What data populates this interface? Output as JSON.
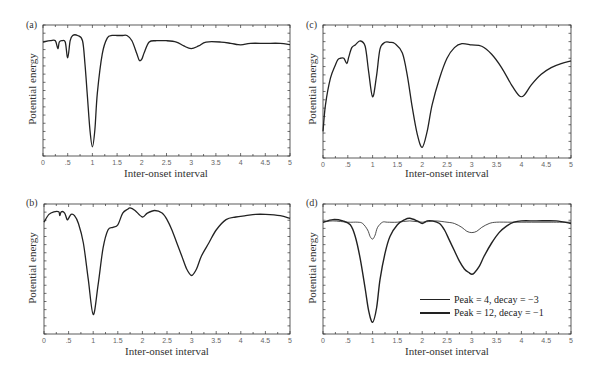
{
  "chart_data": [
    {
      "panel": "(a)",
      "type": "line",
      "xlabel": "Inter-onset interval",
      "ylabel": "Potential energy",
      "xlim": [
        0,
        5
      ],
      "ylim": [
        0,
        1
      ],
      "xticks": [
        "0",
        ".5",
        "1",
        "1.5",
        "2",
        "2.5",
        "3",
        "3.5",
        "4",
        "4.5",
        "5"
      ],
      "yticks_labeled": false,
      "grid": false,
      "frame": {
        "left": 43,
        "top": 25,
        "right": 290,
        "bottom": 156
      },
      "series": [
        {
          "name": "energy",
          "width": 1.3,
          "x": [
            0,
            0.15,
            0.25,
            0.3,
            0.33,
            0.38,
            0.45,
            0.5,
            0.55,
            0.6,
            0.7,
            0.8,
            0.85,
            0.9,
            0.95,
            1.0,
            1.05,
            1.1,
            1.2,
            1.3,
            1.4,
            1.5,
            1.6,
            1.7,
            1.8,
            1.9,
            1.95,
            2.0,
            2.05,
            2.15,
            2.3,
            2.5,
            2.7,
            2.85,
            3.0,
            3.15,
            3.3,
            3.6,
            3.8,
            3.95,
            4.05,
            4.2,
            4.5,
            4.8,
            5.0
          ],
          "y": [
            0.87,
            0.88,
            0.88,
            0.82,
            0.87,
            0.88,
            0.87,
            0.75,
            0.88,
            0.92,
            0.92,
            0.88,
            0.7,
            0.45,
            0.2,
            0.07,
            0.2,
            0.48,
            0.78,
            0.9,
            0.92,
            0.92,
            0.92,
            0.92,
            0.88,
            0.78,
            0.73,
            0.74,
            0.79,
            0.87,
            0.88,
            0.88,
            0.87,
            0.84,
            0.82,
            0.84,
            0.87,
            0.87,
            0.86,
            0.85,
            0.85,
            0.86,
            0.86,
            0.86,
            0.85
          ]
        }
      ]
    },
    {
      "panel": "(b)",
      "type": "line",
      "xlabel": "Inter-onset interval",
      "ylabel": "Potential energy",
      "xlim": [
        0,
        5
      ],
      "ylim": [
        0,
        1
      ],
      "xticks": [
        "0",
        ".5",
        "1",
        "1.5",
        "2",
        "2.5",
        "3",
        "3.5",
        "4",
        "4.5",
        "5"
      ],
      "yticks_labeled": false,
      "grid": false,
      "frame": {
        "left": 44,
        "top": 204,
        "right": 290,
        "bottom": 334
      },
      "series": [
        {
          "name": "energy",
          "width": 1.3,
          "x": [
            0,
            0.1,
            0.2,
            0.3,
            0.32,
            0.35,
            0.42,
            0.47,
            0.5,
            0.55,
            0.62,
            0.7,
            0.8,
            0.9,
            1.0,
            1.1,
            1.2,
            1.3,
            1.4,
            1.5,
            1.6,
            1.7,
            1.75,
            1.85,
            2.0,
            2.1,
            2.25,
            2.4,
            2.5,
            2.6,
            2.7,
            2.8,
            2.9,
            3.0,
            3.1,
            3.2,
            3.35,
            3.5,
            3.7,
            3.9,
            4.1,
            4.3,
            4.5,
            4.8,
            5.0
          ],
          "y": [
            0.86,
            0.92,
            0.94,
            0.94,
            0.91,
            0.94,
            0.93,
            0.88,
            0.89,
            0.92,
            0.91,
            0.85,
            0.7,
            0.42,
            0.15,
            0.38,
            0.66,
            0.8,
            0.82,
            0.84,
            0.93,
            0.96,
            0.97,
            0.95,
            0.9,
            0.93,
            0.95,
            0.93,
            0.88,
            0.8,
            0.7,
            0.6,
            0.5,
            0.45,
            0.5,
            0.6,
            0.7,
            0.8,
            0.88,
            0.9,
            0.91,
            0.92,
            0.92,
            0.91,
            0.89
          ]
        }
      ]
    },
    {
      "panel": "(c)",
      "type": "line",
      "xlabel": "Inter-onset interval",
      "ylabel": "Potential energy",
      "xlim": [
        0,
        5
      ],
      "ylim": [
        0,
        1
      ],
      "xticks": [
        "0",
        ".5",
        "1",
        "1.5",
        "2",
        "2.5",
        "3",
        "3.5",
        "4",
        "4.5",
        "5"
      ],
      "yticks_labeled": false,
      "grid": false,
      "frame": {
        "left": 323,
        "top": 25,
        "right": 571,
        "bottom": 158
      },
      "series": [
        {
          "name": "energy",
          "width": 1.3,
          "x": [
            0,
            0.05,
            0.15,
            0.25,
            0.3,
            0.35,
            0.42,
            0.48,
            0.52,
            0.58,
            0.65,
            0.75,
            0.85,
            0.92,
            1.0,
            1.08,
            1.15,
            1.25,
            1.35,
            1.45,
            1.6,
            1.7,
            1.8,
            1.9,
            2.0,
            2.1,
            2.2,
            2.35,
            2.5,
            2.65,
            2.8,
            3.0,
            3.2,
            3.4,
            3.6,
            3.8,
            3.95,
            4.05,
            4.2,
            4.4,
            4.6,
            4.8,
            5.0
          ],
          "y": [
            0.2,
            0.4,
            0.6,
            0.7,
            0.74,
            0.75,
            0.75,
            0.71,
            0.76,
            0.83,
            0.85,
            0.88,
            0.84,
            0.65,
            0.46,
            0.62,
            0.82,
            0.87,
            0.87,
            0.86,
            0.79,
            0.62,
            0.38,
            0.18,
            0.08,
            0.2,
            0.4,
            0.6,
            0.75,
            0.83,
            0.86,
            0.85,
            0.84,
            0.78,
            0.68,
            0.55,
            0.47,
            0.47,
            0.55,
            0.63,
            0.68,
            0.71,
            0.73
          ]
        }
      ]
    },
    {
      "panel": "(d)",
      "type": "line",
      "xlabel": "Inter-onset interval",
      "ylabel": "Potential energy",
      "xlim": [
        0,
        5
      ],
      "ylim": [
        0,
        1
      ],
      "xticks": [
        "0",
        ".5",
        "1",
        "1.5",
        "2",
        "2.5",
        "3",
        "3.5",
        "4",
        "4.5",
        "5"
      ],
      "yticks_labeled": false,
      "grid": false,
      "frame": {
        "left": 323,
        "top": 204,
        "right": 571,
        "bottom": 334
      },
      "legend": {
        "position": "lower right"
      },
      "series": [
        {
          "name": "Peak = 4, decay = −3",
          "width": 0.8,
          "x": [
            0,
            0.2,
            0.5,
            0.7,
            0.8,
            0.9,
            0.95,
            1.0,
            1.05,
            1.1,
            1.2,
            1.3,
            1.5,
            1.75,
            2.0,
            2.25,
            2.5,
            2.65,
            2.8,
            2.9,
            3.0,
            3.1,
            3.2,
            3.35,
            3.5,
            3.8,
            4.2,
            4.6,
            5.0
          ],
          "y": [
            0.86,
            0.87,
            0.86,
            0.86,
            0.85,
            0.8,
            0.75,
            0.73,
            0.76,
            0.82,
            0.86,
            0.86,
            0.86,
            0.87,
            0.86,
            0.87,
            0.86,
            0.85,
            0.82,
            0.79,
            0.78,
            0.79,
            0.82,
            0.85,
            0.86,
            0.86,
            0.86,
            0.86,
            0.86
          ]
        },
        {
          "name": "Peak = 12, decay = −1",
          "width": 1.4,
          "x": [
            0,
            0.2,
            0.4,
            0.55,
            0.65,
            0.75,
            0.85,
            0.92,
            1.0,
            1.08,
            1.15,
            1.25,
            1.35,
            1.5,
            1.65,
            1.75,
            1.9,
            2.0,
            2.1,
            2.2,
            2.35,
            2.45,
            2.55,
            2.65,
            2.75,
            2.85,
            2.95,
            3.0,
            3.05,
            3.15,
            3.25,
            3.4,
            3.55,
            3.7,
            3.85,
            4.0,
            4.3,
            4.7,
            5.0
          ],
          "y": [
            0.86,
            0.88,
            0.87,
            0.84,
            0.75,
            0.58,
            0.35,
            0.18,
            0.09,
            0.2,
            0.42,
            0.62,
            0.75,
            0.84,
            0.88,
            0.89,
            0.87,
            0.85,
            0.87,
            0.87,
            0.85,
            0.8,
            0.72,
            0.64,
            0.56,
            0.5,
            0.47,
            0.46,
            0.47,
            0.52,
            0.6,
            0.7,
            0.78,
            0.83,
            0.86,
            0.87,
            0.87,
            0.87,
            0.85
          ]
        }
      ]
    }
  ],
  "panels": {
    "a": {
      "label": "(a)",
      "xlabel": "Inter-onset interval",
      "ylabel": "Potential energy"
    },
    "b": {
      "label": "(b)",
      "xlabel": "Inter-onset interval",
      "ylabel": "Potential energy"
    },
    "c": {
      "label": "(c)",
      "xlabel": "Inter-onset interval",
      "ylabel": "Potential energy"
    },
    "d": {
      "label": "(d)",
      "xlabel": "Inter-onset interval",
      "ylabel": "Potential energy"
    }
  },
  "legend": {
    "items": [
      {
        "label": "Peak = 4, decay = −3",
        "style": "thin"
      },
      {
        "label": "Peak = 12, decay = −1",
        "style": "thick"
      }
    ]
  },
  "colors": {
    "line": "#222222",
    "axis": "#333333",
    "tick_label": "#666666"
  }
}
